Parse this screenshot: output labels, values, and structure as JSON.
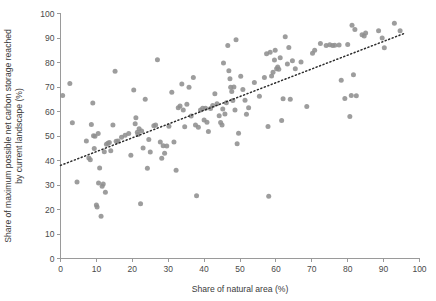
{
  "chart_data": {
    "type": "scatter",
    "title": "",
    "xlabel": "Share of natural area (%)",
    "ylabel": "Share of maximum possible net carbon storage reached by current landscape (%)",
    "xlim": [
      0,
      100
    ],
    "ylim": [
      0,
      100
    ],
    "xticks": [
      0,
      10,
      20,
      30,
      40,
      50,
      60,
      70,
      80,
      90,
      100
    ],
    "yticks": [
      0,
      10,
      20,
      30,
      40,
      50,
      60,
      70,
      80,
      90,
      100
    ],
    "xtick_labels": [
      "0",
      "10",
      "20",
      "30",
      "40",
      "50",
      "60",
      "70",
      "80",
      "90",
      "100"
    ],
    "ytick_labels": [
      "0",
      "10",
      "20",
      "30",
      "40",
      "50",
      "60",
      "70",
      "80",
      "90",
      "100"
    ],
    "grid": false,
    "legend": null,
    "marker_color": "#8f8f8f",
    "marker_size": 5,
    "trendline": {
      "style": "dotted",
      "color": "#2c2c2c",
      "x_start": 0,
      "y_start": 38,
      "x_end": 96,
      "y_end": 92
    },
    "points": [
      [
        0.6,
        66.5
      ],
      [
        2.6,
        71.4
      ],
      [
        3.3,
        55.4
      ],
      [
        4.6,
        31.2
      ],
      [
        7.2,
        48.0
      ],
      [
        7.9,
        41.0
      ],
      [
        8.3,
        40.3
      ],
      [
        8.6,
        54.7
      ],
      [
        9.0,
        63.5
      ],
      [
        9.2,
        50.1
      ],
      [
        9.4,
        44.9
      ],
      [
        9.6,
        49.9
      ],
      [
        10.0,
        21.8
      ],
      [
        10.2,
        21.0
      ],
      [
        10.5,
        51.0
      ],
      [
        10.6,
        30.8
      ],
      [
        10.9,
        36.9
      ],
      [
        11.3,
        17.2
      ],
      [
        11.6,
        29.5
      ],
      [
        11.9,
        30.4
      ],
      [
        12.2,
        43.6
      ],
      [
        12.5,
        27.0
      ],
      [
        12.8,
        46.6
      ],
      [
        13.2,
        47.0
      ],
      [
        13.6,
        47.3
      ],
      [
        14.0,
        44.0
      ],
      [
        14.6,
        54.5
      ],
      [
        15.2,
        76.4
      ],
      [
        15.5,
        47.9
      ],
      [
        16.0,
        48.0
      ],
      [
        17.0,
        49.5
      ],
      [
        18.0,
        50.3
      ],
      [
        19.0,
        51.0
      ],
      [
        19.6,
        42.1
      ],
      [
        20.4,
        68.8
      ],
      [
        20.8,
        55.0
      ],
      [
        21.0,
        57.5
      ],
      [
        21.4,
        51.5
      ],
      [
        21.6,
        50.6
      ],
      [
        21.9,
        53.0
      ],
      [
        22.3,
        22.3
      ],
      [
        22.6,
        52.0
      ],
      [
        23.0,
        45.1
      ],
      [
        23.6,
        65.0
      ],
      [
        24.2,
        36.8
      ],
      [
        24.6,
        48.6
      ],
      [
        25.0,
        43.5
      ],
      [
        26.0,
        54.2
      ],
      [
        26.5,
        54.5
      ],
      [
        27.0,
        81.1
      ],
      [
        27.8,
        47.6
      ],
      [
        28.2,
        40.9
      ],
      [
        28.6,
        46.0
      ],
      [
        29.0,
        43.0
      ],
      [
        29.6,
        45.9
      ],
      [
        30.2,
        54.0
      ],
      [
        31.0,
        67.9
      ],
      [
        31.6,
        47.6
      ],
      [
        32.2,
        36.0
      ],
      [
        32.8,
        61.5
      ],
      [
        33.3,
        62.2
      ],
      [
        33.8,
        71.2
      ],
      [
        34.2,
        60.6
      ],
      [
        34.6,
        53.8
      ],
      [
        35.2,
        63.0
      ],
      [
        35.8,
        69.9
      ],
      [
        36.4,
        58.2
      ],
      [
        37.0,
        73.9
      ],
      [
        37.6,
        54.5
      ],
      [
        37.9,
        25.6
      ],
      [
        38.4,
        53.6
      ],
      [
        39.0,
        60.6
      ],
      [
        39.6,
        61.3
      ],
      [
        40.0,
        56.5
      ],
      [
        40.4,
        61.3
      ],
      [
        40.8,
        55.6
      ],
      [
        41.2,
        51.8
      ],
      [
        41.8,
        61.2
      ],
      [
        42.4,
        62.5
      ],
      [
        43.0,
        67.2
      ],
      [
        43.6,
        63.2
      ],
      [
        44.2,
        58.3
      ],
      [
        44.6,
        55.5
      ],
      [
        45.0,
        54.5
      ],
      [
        45.2,
        61.0
      ],
      [
        45.4,
        79.8
      ],
      [
        45.8,
        59.0
      ],
      [
        46.2,
        63.6
      ],
      [
        46.6,
        86.9
      ],
      [
        46.9,
        76.6
      ],
      [
        47.2,
        73.4
      ],
      [
        47.4,
        69.9
      ],
      [
        47.7,
        68.2
      ],
      [
        48.0,
        64.5
      ],
      [
        48.3,
        70.0
      ],
      [
        48.6,
        60.6
      ],
      [
        48.9,
        89.3
      ],
      [
        49.2,
        46.8
      ],
      [
        49.6,
        51.1
      ],
      [
        50.2,
        74.4
      ],
      [
        50.8,
        69.0
      ],
      [
        51.4,
        64.6
      ],
      [
        51.8,
        58.9
      ],
      [
        52.4,
        61.5
      ],
      [
        54.0,
        71.8
      ],
      [
        55.4,
        66.2
      ],
      [
        56.8,
        73.9
      ],
      [
        57.4,
        83.6
      ],
      [
        57.8,
        53.9
      ],
      [
        58.0,
        25.4
      ],
      [
        58.4,
        84.2
      ],
      [
        58.8,
        74.5
      ],
      [
        59.2,
        76.0
      ],
      [
        59.6,
        81.0
      ],
      [
        59.8,
        85.0
      ],
      [
        60.2,
        77.5
      ],
      [
        60.5,
        78.2
      ],
      [
        60.8,
        77.2
      ],
      [
        61.2,
        81.9
      ],
      [
        61.6,
        56.3
      ],
      [
        62.0,
        65.2
      ],
      [
        62.6,
        90.5
      ],
      [
        63.2,
        79.4
      ],
      [
        63.6,
        86.1
      ],
      [
        64.0,
        65.0
      ],
      [
        64.6,
        80.7
      ],
      [
        65.4,
        77.4
      ],
      [
        67.0,
        80.2
      ],
      [
        68.6,
        62.0
      ],
      [
        70.2,
        83.8
      ],
      [
        70.8,
        85.0
      ],
      [
        72.4,
        87.8
      ],
      [
        74.0,
        86.9
      ],
      [
        75.0,
        87.2
      ],
      [
        75.8,
        86.9
      ],
      [
        76.4,
        87.0
      ],
      [
        77.6,
        87.1
      ],
      [
        78.2,
        72.8
      ],
      [
        79.2,
        65.3
      ],
      [
        80.0,
        87.3
      ],
      [
        80.6,
        58.0
      ],
      [
        81.0,
        66.5
      ],
      [
        81.2,
        95.2
      ],
      [
        81.6,
        75.0
      ],
      [
        82.0,
        93.5
      ],
      [
        82.4,
        66.4
      ],
      [
        84.0,
        91.3
      ],
      [
        84.6,
        90.8
      ],
      [
        85.0,
        92.0
      ],
      [
        88.6,
        93.0
      ],
      [
        89.6,
        90.0
      ],
      [
        90.2,
        86.0
      ],
      [
        93.0,
        96.0
      ],
      [
        94.6,
        93.0
      ]
    ]
  },
  "axes": {
    "x_title": "Share of natural area (%)",
    "y_title_line1": "Share of maximum possible net carbon storage reached",
    "y_title_line2": "by current landscape (%)"
  },
  "top_crumb": ""
}
